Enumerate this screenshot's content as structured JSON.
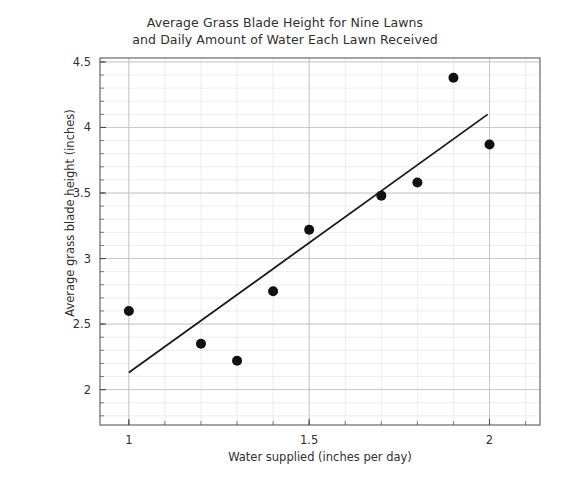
{
  "chart_data": {
    "type": "scatter",
    "title": "Average Grass Blade Height for Nine Lawns\nand Daily Amount of Water Each Lawn Received",
    "xlabel": "Water supplied (inches per day)",
    "ylabel": "Average grass blade height (inches)",
    "xlim": [
      0.92,
      2.14
    ],
    "ylim": [
      1.73,
      4.53
    ],
    "xticks": [
      1,
      1.5,
      2
    ],
    "xtick_labels": [
      "1",
      "1.5",
      "2"
    ],
    "yticks": [
      2,
      2.5,
      3,
      3.5,
      4,
      4.5
    ],
    "ytick_labels": [
      "2",
      "2.5",
      "3",
      "3.5",
      "4",
      "4.5"
    ],
    "x_minor_step": 0.1,
    "y_minor_step": 0.1,
    "grid": true,
    "grid_color": "#d9d9d9",
    "legend": null,
    "marker_color": "#111111",
    "marker_size": 7,
    "x": [
      1.0,
      1.2,
      1.3,
      1.4,
      1.5,
      1.7,
      1.8,
      1.9,
      2.0
    ],
    "y": [
      2.6,
      2.35,
      2.22,
      2.75,
      3.22,
      3.48,
      3.58,
      4.38,
      3.87
    ],
    "points": [
      {
        "x": 1.0,
        "y": 2.6
      },
      {
        "x": 1.2,
        "y": 2.35
      },
      {
        "x": 1.3,
        "y": 2.22
      },
      {
        "x": 1.4,
        "y": 2.75
      },
      {
        "x": 1.5,
        "y": 3.22
      },
      {
        "x": 1.7,
        "y": 3.48
      },
      {
        "x": 1.8,
        "y": 3.58
      },
      {
        "x": 1.9,
        "y": 4.38
      },
      {
        "x": 2.0,
        "y": 3.87
      }
    ],
    "trend_line": {
      "color": "#1a1a1a",
      "width": 1.8,
      "x0": 1.0,
      "y0": 2.13,
      "x1": 1.995,
      "y1": 4.1
    }
  }
}
